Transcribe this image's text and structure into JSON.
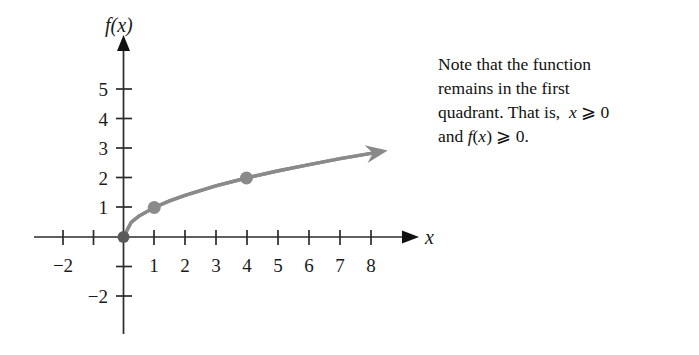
{
  "note": {
    "name": "first-quadrant-note",
    "lines": [
      "Note that the function",
      "remains in the first",
      "quadrant. That is,  x ⩾ 0",
      "and f(x) ⩾ 0."
    ],
    "full_text": "Note that the function remains in the first quadrant. That is, x ⩾ 0 and f(x) ⩾ 0."
  },
  "chart_data": {
    "type": "line",
    "title": "",
    "xlabel": "x",
    "ylabel": "f(x)",
    "function": "f(x) = √x",
    "xlim": [
      -2.6,
      9.5
    ],
    "ylim": [
      -3.2,
      6.3
    ],
    "grid": false,
    "legend": null,
    "x_ticks": [
      -2,
      -1,
      1,
      2,
      3,
      4,
      5,
      6,
      7,
      8
    ],
    "x_tick_labels": [
      "−2",
      "",
      "1",
      "2",
      "3",
      "4",
      "5",
      "6",
      "7",
      "8"
    ],
    "y_ticks": [
      -2,
      -1,
      1,
      2,
      3,
      4,
      5
    ],
    "y_tick_labels": [
      "−2",
      "",
      "1",
      "2",
      "3",
      "4",
      "5"
    ],
    "x": [
      0,
      0.25,
      0.5,
      1,
      1.5,
      2,
      3,
      4,
      5,
      6,
      7,
      8,
      8.4
    ],
    "values": [
      0,
      0.5,
      0.707,
      1,
      1.225,
      1.414,
      1.732,
      2,
      2.236,
      2.449,
      2.646,
      2.828,
      2.898
    ],
    "series": [
      {
        "name": "f(x) = √x",
        "color": "#8a8a8a",
        "x": [
          0,
          0.25,
          0.5,
          1,
          1.5,
          2,
          3,
          4,
          5,
          6,
          7,
          8,
          8.4
        ],
        "values": [
          0,
          0.5,
          0.707,
          1,
          1.225,
          1.414,
          1.732,
          2,
          2.236,
          2.449,
          2.646,
          2.828,
          2.898
        ],
        "arrow_end": true
      }
    ],
    "marked_points": [
      {
        "label": "origin",
        "x": 0,
        "y": 0,
        "color": "#5a5a5a"
      },
      {
        "label": "point-1-1",
        "x": 1,
        "y": 1,
        "color": "#8a8a8a"
      },
      {
        "label": "point-4-2",
        "x": 4,
        "y": 2,
        "color": "#8a8a8a"
      }
    ],
    "axis_color": "#2b2b2b",
    "curve_color": "#8a8a8a"
  }
}
